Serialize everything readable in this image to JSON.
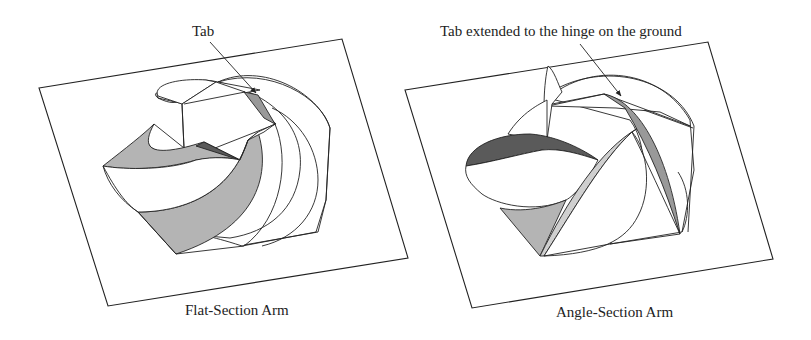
{
  "figures": [
    {
      "id": "flat",
      "caption": "Flat-Section Arm",
      "annotation": "Tab"
    },
    {
      "id": "angle",
      "caption": "Angle-Section Arm",
      "annotation": "Tab extended to the hinge on the ground"
    }
  ],
  "colors": {
    "shade_mid": "#b4b4b4",
    "shade_light": "#cfcfcf",
    "shade_dark": "#5a5a5a",
    "shade_grey": "#999999",
    "line": "#222222"
  }
}
